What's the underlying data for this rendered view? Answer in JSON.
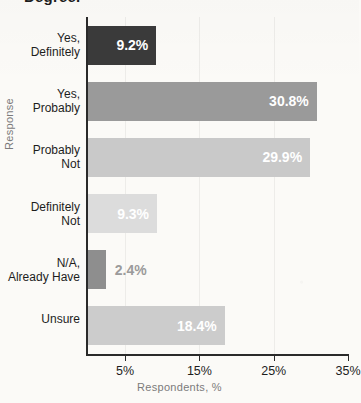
{
  "chart_data": {
    "type": "bar",
    "orientation": "horizontal",
    "title": "Degree.",
    "title_truncated": true,
    "xlabel": "Respondents, %",
    "ylabel": "Response",
    "categories": [
      "Yes,\nDefinitely",
      "Yes,\nProbably",
      "Probably\nNot",
      "Definitely\nNot",
      "N/A,\nAlready Have",
      "Unsure"
    ],
    "values": [
      9.2,
      30.8,
      29.9,
      9.3,
      2.4,
      18.4
    ],
    "value_labels": [
      "9.2%",
      "30.8%",
      "29.9%",
      "9.3%",
      "2.4%",
      "18.4%"
    ],
    "bar_colors": [
      "#3a3a3a",
      "#9a9a9a",
      "#c9c9c9",
      "#dcdcdc",
      "#8e8e8e",
      "#cccccc"
    ],
    "label_inside": [
      true,
      true,
      true,
      true,
      false,
      true
    ],
    "xlim": [
      0,
      35
    ],
    "xticks": [
      5,
      15,
      25,
      35
    ],
    "xticklabels": [
      "5%",
      "15%",
      "25%",
      "35%"
    ],
    "grid": true,
    "legend": null
  }
}
